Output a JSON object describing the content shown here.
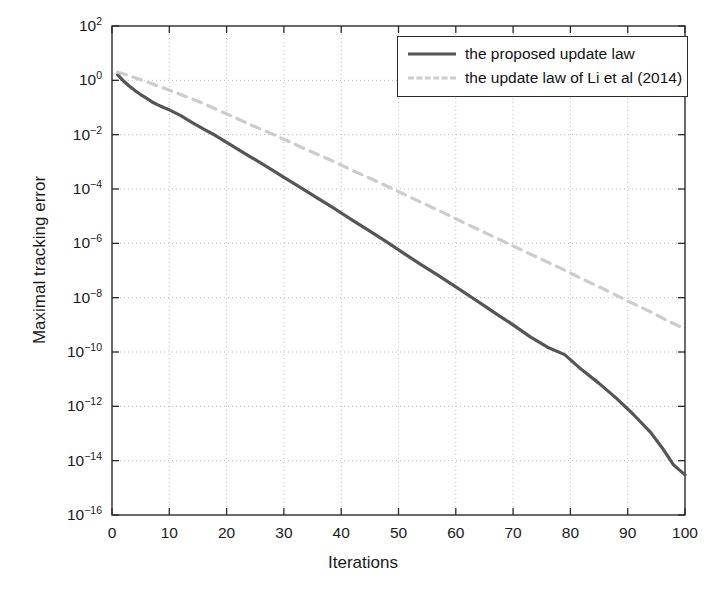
{
  "chart_data": {
    "type": "line",
    "title": "",
    "xlabel": "Iterations",
    "ylabel": "Maximal tracking error",
    "xlim": [
      0,
      100
    ],
    "ylim": [
      1e-16,
      100
    ],
    "yscale": "log",
    "xscale": "linear",
    "grid": true,
    "xticks": [
      0,
      10,
      20,
      30,
      40,
      50,
      60,
      70,
      80,
      90,
      100
    ],
    "xtick_labels": [
      "0",
      "10",
      "20",
      "30",
      "40",
      "50",
      "60",
      "70",
      "80",
      "90",
      "100"
    ],
    "ytick_exponents": [
      2,
      0,
      -2,
      -4,
      -6,
      -8,
      -10,
      -12,
      -14,
      -16
    ],
    "ytick_labels": [
      "10^2",
      "10^0",
      "10^-2",
      "10^-4",
      "10^-6",
      "10^-8",
      "10^-10",
      "10^-12",
      "10^-14",
      "10^-16"
    ],
    "legend_position": "top-right",
    "series": [
      {
        "name": "the proposed update law",
        "style": "solid",
        "color": "#555555",
        "width": 3.2,
        "x": [
          1,
          2,
          3,
          4,
          5,
          6,
          7,
          8,
          9,
          10,
          12,
          14,
          16,
          18,
          20,
          22,
          24,
          26,
          28,
          30,
          33,
          36,
          39,
          42,
          45,
          48,
          51,
          54,
          57,
          60,
          63,
          65,
          67,
          70,
          73,
          76,
          79,
          82,
          85,
          88,
          91,
          94,
          96,
          98,
          100
        ],
        "y": [
          1.6,
          0.95,
          0.62,
          0.42,
          0.3,
          0.22,
          0.16,
          0.125,
          0.1,
          0.082,
          0.05,
          0.028,
          0.016,
          0.0095,
          0.0052,
          0.0029,
          0.0016,
          0.0009,
          0.0005,
          0.00027,
          0.00011,
          4.4e-05,
          1.8e-05,
          7e-06,
          2.8e-06,
          1.1e-06,
          4.2e-07,
          1.6e-07,
          6.5e-08,
          2.5e-08,
          9.5e-09,
          5e-09,
          2.6e-09,
          1e-09,
          3.6e-10,
          1.5e-10,
          8e-11,
          2.2e-11,
          7e-12,
          2e-12,
          5e-13,
          1.1e-13,
          3e-14,
          7e-15,
          3e-15
        ]
      },
      {
        "name": "the update law of Li et al (2014)",
        "style": "dashed",
        "color": "#cccccc",
        "width": 3.2,
        "x": [
          1,
          3,
          5,
          7,
          9,
          11,
          13,
          15,
          18,
          21,
          24,
          27,
          30,
          34,
          38,
          42,
          46,
          50,
          54,
          58,
          62,
          66,
          70,
          74,
          78,
          82,
          86,
          90,
          94,
          97,
          100
        ],
        "y": [
          2.0,
          1.5,
          1.05,
          0.75,
          0.52,
          0.36,
          0.25,
          0.17,
          0.09,
          0.047,
          0.024,
          0.013,
          0.0068,
          0.0028,
          0.0012,
          0.00048,
          0.0002,
          8e-05,
          3.2e-05,
          1.3e-05,
          5e-06,
          2e-06,
          8e-07,
          3.2e-07,
          1.3e-07,
          5e-08,
          2e-08,
          7.5e-09,
          3e-09,
          1.4e-09,
          7e-10
        ]
      }
    ]
  },
  "legend": {
    "entries": [
      {
        "label": "the proposed update law",
        "sample": "solid-line-sample"
      },
      {
        "label": "the update law of Li et al (2014)",
        "sample": "dashed-line-sample"
      }
    ]
  },
  "colors": {
    "solid_series": "#555555",
    "dashed_series": "#cccccc",
    "axis": "#2b2b2b",
    "grid": "#bdbdbd",
    "text": "#1a1a1a",
    "background": "#ffffff"
  }
}
